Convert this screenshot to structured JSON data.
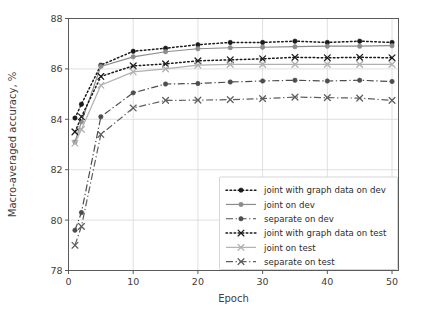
{
  "chart_data": {
    "type": "line",
    "title": "",
    "xlabel": "Epoch",
    "ylabel": "Macro-averaged accuracy, %",
    "xlim": [
      0,
      51
    ],
    "ylim": [
      78,
      88
    ],
    "xticks": [
      0,
      10,
      20,
      30,
      40,
      50
    ],
    "yticks": [
      78,
      80,
      82,
      84,
      86,
      88
    ],
    "xtick_labels": [
      "0",
      "10",
      "20",
      "30",
      "40",
      "50"
    ],
    "ytick_labels": [
      "78",
      "80",
      "82",
      "84",
      "86",
      "88"
    ],
    "grid": true,
    "legend_position": "lower right",
    "x": [
      1,
      2,
      5,
      10,
      15,
      20,
      25,
      30,
      35,
      40,
      45,
      50
    ],
    "series": [
      {
        "name": "joint with graph data on dev",
        "values": [
          84.05,
          84.6,
          86.15,
          86.7,
          86.82,
          86.96,
          87.05,
          87.05,
          87.1,
          87.05,
          87.1,
          87.05
        ],
        "color": "#1a1a1a",
        "linestyle": "dotted",
        "marker": "circle"
      },
      {
        "name": "joint on dev",
        "values": [
          83.1,
          83.9,
          86.1,
          86.48,
          86.68,
          86.8,
          86.84,
          86.86,
          86.88,
          86.9,
          86.9,
          86.92
        ],
        "color": "#8c8c8c",
        "linestyle": "solid",
        "marker": "circle"
      },
      {
        "name": "separate on dev",
        "values": [
          79.6,
          80.3,
          84.1,
          85.05,
          85.4,
          85.42,
          85.48,
          85.52,
          85.55,
          85.52,
          85.55,
          85.5
        ],
        "color": "#4d4d4d",
        "linestyle": "dashdot",
        "marker": "circle"
      },
      {
        "name": "joint with graph data on test",
        "values": [
          83.5,
          84.1,
          85.7,
          86.12,
          86.2,
          86.32,
          86.36,
          86.4,
          86.46,
          86.44,
          86.46,
          86.44
        ],
        "color": "#1a1a1a",
        "linestyle": "dotted",
        "marker": "x"
      },
      {
        "name": "joint on test",
        "values": [
          83.05,
          83.6,
          85.35,
          85.88,
          86.0,
          86.15,
          86.18,
          86.18,
          86.18,
          86.18,
          86.18,
          86.18
        ],
        "color": "#b0b0b0",
        "linestyle": "solid",
        "marker": "x"
      },
      {
        "name": "separate on test",
        "values": [
          79.0,
          79.75,
          83.4,
          84.45,
          84.75,
          84.76,
          84.78,
          84.82,
          84.88,
          84.86,
          84.84,
          84.75
        ],
        "color": "#5e5e5e",
        "linestyle": "dashdot",
        "marker": "x"
      }
    ]
  },
  "legend": {
    "entries": [
      "joint with graph data on dev",
      "joint on dev",
      "separate on dev",
      "joint with graph data on test",
      "joint on test",
      "separate on test"
    ]
  }
}
